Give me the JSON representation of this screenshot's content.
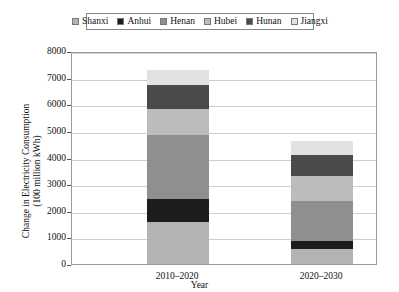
{
  "chart_data": {
    "type": "bar",
    "stacked": true,
    "title": "",
    "xlabel": "Year",
    "ylabel": "Change in Electricity Consumption\n(100 million kWh)",
    "ylabel_line1": "Change in Electricity Consumption",
    "ylabel_line2": "(100 million kWh)",
    "categories": [
      "2010–2020",
      "2020–2030"
    ],
    "ylim": [
      0,
      8000
    ],
    "ytick_step": 1000,
    "yticks": [
      "0",
      "1000",
      "2000",
      "3000",
      "4000",
      "5000",
      "6000",
      "7000",
      "8000"
    ],
    "grid": true,
    "legend_position": "top-center",
    "series": [
      {
        "name": "Shanxi",
        "color": "#b3b3b3",
        "values": [
          1560,
          560
        ]
      },
      {
        "name": "Anhui",
        "color": "#1c1c1c",
        "values": [
          870,
          310
        ]
      },
      {
        "name": "Henan",
        "color": "#8f8f8f",
        "values": [
          2400,
          1500
        ]
      },
      {
        "name": "Hubei",
        "color": "#bcbcbc",
        "values": [
          1010,
          940
        ]
      },
      {
        "name": "Hunan",
        "color": "#4a4a4a",
        "values": [
          870,
          790
        ]
      },
      {
        "name": "Jiangxi",
        "color": "#e2e2e2",
        "values": [
          590,
          510
        ]
      }
    ],
    "totals": [
      7300,
      4610
    ],
    "axis_color": "#9a9a9a",
    "grid_color": "#cfcfcf",
    "background": "#ffffff"
  }
}
